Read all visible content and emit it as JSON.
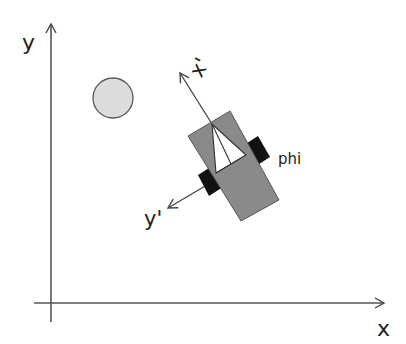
{
  "diagram": {
    "axes": {
      "x_label": "x",
      "y_label": "y"
    },
    "robot_frame": {
      "x_prime_label": "x'",
      "y_prime_label": "y'",
      "heading_label": "phi"
    },
    "obstacle": {
      "shape": "circle"
    },
    "colors": {
      "axis": "#444444",
      "robot_body": "#8a8a8a",
      "robot_outline": "#555555",
      "wheel": "#111111",
      "sensor_cone": "#ffffff",
      "obstacle_fill": "#dcdcdc",
      "obstacle_outline": "#555555"
    }
  }
}
